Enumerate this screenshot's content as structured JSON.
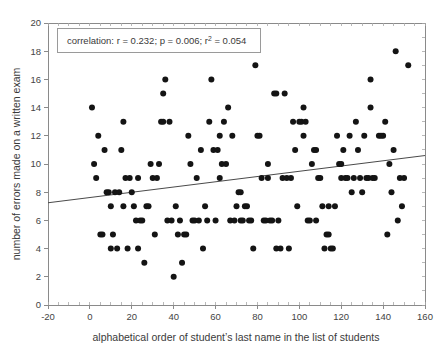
{
  "chart_data": {
    "type": "scatter",
    "title": "",
    "xlabel": "alphabetical order of student’s last name in the list of students",
    "ylabel": "number of errors made on a written exam",
    "xlim": [
      -20,
      160
    ],
    "ylim": [
      0,
      20
    ],
    "xticks": [
      -20,
      0,
      20,
      40,
      60,
      80,
      100,
      120,
      140,
      160
    ],
    "xtick_labels": [
      "-20",
      "0",
      "20",
      "40",
      "60",
      "80",
      "100",
      "120",
      "140",
      "160"
    ],
    "yticks": [
      0,
      2,
      4,
      6,
      8,
      10,
      12,
      14,
      16,
      18,
      20
    ],
    "ytick_labels": [
      "0",
      "2",
      "4",
      "6",
      "8",
      "10",
      "12",
      "14",
      "16",
      "18",
      "20"
    ],
    "grid": false,
    "legend": null,
    "marker": "filled-circle",
    "marker_color": "#141414",
    "marker_size": 3.0,
    "annotation": {
      "text_full": "correlation: r = 0.232; p = 0.006; r² = 0.054",
      "prefix": "correlation: r = 0.232; p = 0.006; r",
      "superscript": "2",
      "suffix": " = 0.054",
      "box_border_color": "#9a9a9a",
      "box_fill_color": "#ffffff"
    },
    "trendline": {
      "type": "linear-fit",
      "color": "#4a4a4a",
      "x_start": -20,
      "y_start": 7.25,
      "x_end": 160,
      "y_end": 10.6,
      "slope": 0.0186,
      "intercept": 7.62
    },
    "statistics": {
      "r": 0.232,
      "p": 0.006,
      "r_squared": 0.054
    },
    "points": [
      [
        1,
        14
      ],
      [
        2,
        10
      ],
      [
        3,
        9
      ],
      [
        4,
        12
      ],
      [
        5,
        5
      ],
      [
        6,
        5
      ],
      [
        7,
        11
      ],
      [
        9,
        8
      ],
      [
        10,
        7
      ],
      [
        10,
        4
      ],
      [
        11,
        5
      ],
      [
        12,
        8
      ],
      [
        13,
        4
      ],
      [
        14,
        8
      ],
      [
        15,
        11
      ],
      [
        16,
        13
      ],
      [
        16,
        7
      ],
      [
        17,
        9
      ],
      [
        18,
        4
      ],
      [
        20,
        8
      ],
      [
        21,
        7
      ],
      [
        22,
        6
      ],
      [
        23,
        4
      ],
      [
        23,
        9
      ],
      [
        24,
        6
      ],
      [
        25,
        6
      ],
      [
        26,
        3
      ],
      [
        27,
        7
      ],
      [
        29,
        10
      ],
      [
        30,
        9
      ],
      [
        31,
        5
      ],
      [
        32,
        9
      ],
      [
        34,
        13
      ],
      [
        35,
        13
      ],
      [
        35,
        15
      ],
      [
        36,
        16
      ],
      [
        38,
        13
      ],
      [
        39,
        6
      ],
      [
        40,
        2
      ],
      [
        41,
        7
      ],
      [
        42,
        5
      ],
      [
        43,
        6
      ],
      [
        44,
        3
      ],
      [
        45,
        5
      ],
      [
        46,
        5
      ],
      [
        47,
        12
      ],
      [
        48,
        10
      ],
      [
        49,
        6
      ],
      [
        50,
        6
      ],
      [
        51,
        9
      ],
      [
        52,
        6
      ],
      [
        53,
        11
      ],
      [
        54,
        4
      ],
      [
        55,
        7
      ],
      [
        56,
        6
      ],
      [
        57,
        13
      ],
      [
        58,
        16
      ],
      [
        59,
        11
      ],
      [
        61,
        11
      ],
      [
        62,
        9
      ],
      [
        62,
        12
      ],
      [
        63,
        10
      ],
      [
        64,
        13
      ],
      [
        65,
        10
      ],
      [
        66,
        14
      ],
      [
        67,
        6
      ],
      [
        69,
        6
      ],
      [
        70,
        7
      ],
      [
        71,
        8
      ],
      [
        72,
        8
      ],
      [
        72,
        6
      ],
      [
        74,
        7
      ],
      [
        75,
        7
      ],
      [
        76,
        6
      ],
      [
        78,
        4
      ],
      [
        79,
        17
      ],
      [
        80,
        12
      ],
      [
        81,
        12
      ],
      [
        82,
        9
      ],
      [
        83,
        6
      ],
      [
        84,
        6
      ],
      [
        85,
        10
      ],
      [
        85,
        9
      ],
      [
        86,
        6
      ],
      [
        88,
        15
      ],
      [
        89,
        15
      ],
      [
        89,
        4
      ],
      [
        90,
        6
      ],
      [
        91,
        4
      ],
      [
        92,
        9
      ],
      [
        93,
        15
      ],
      [
        94,
        9
      ],
      [
        95,
        4
      ],
      [
        97,
        13
      ],
      [
        98,
        11
      ],
      [
        99,
        7
      ],
      [
        100,
        13
      ],
      [
        101,
        13
      ],
      [
        102,
        12
      ],
      [
        102,
        14
      ],
      [
        103,
        13
      ],
      [
        104,
        6
      ],
      [
        105,
        6
      ],
      [
        106,
        10
      ],
      [
        107,
        11
      ],
      [
        108,
        11
      ],
      [
        108,
        6
      ],
      [
        110,
        9
      ],
      [
        111,
        7
      ],
      [
        112,
        4
      ],
      [
        113,
        5
      ],
      [
        114,
        5
      ],
      [
        114,
        7
      ],
      [
        115,
        4
      ],
      [
        117,
        7
      ],
      [
        118,
        12
      ],
      [
        119,
        10
      ],
      [
        120,
        10
      ],
      [
        120,
        9
      ],
      [
        121,
        11
      ],
      [
        122,
        9
      ],
      [
        124,
        12
      ],
      [
        125,
        8
      ],
      [
        126,
        9
      ],
      [
        127,
        13
      ],
      [
        128,
        11
      ],
      [
        129,
        9
      ],
      [
        130,
        8
      ],
      [
        131,
        12
      ],
      [
        132,
        9
      ],
      [
        133,
        9
      ],
      [
        134,
        14
      ],
      [
        134,
        16
      ],
      [
        136,
        9
      ],
      [
        138,
        12
      ],
      [
        140,
        12
      ],
      [
        141,
        13
      ],
      [
        142,
        5
      ],
      [
        143,
        10
      ],
      [
        144,
        8
      ],
      [
        145,
        11
      ],
      [
        146,
        18
      ],
      [
        147,
        6
      ],
      [
        148,
        9
      ],
      [
        149,
        7
      ],
      [
        150,
        9
      ],
      [
        152,
        17
      ],
      [
        8,
        8
      ],
      [
        19,
        9
      ],
      [
        28,
        7
      ],
      [
        33,
        10
      ],
      [
        37,
        6
      ],
      [
        60,
        6
      ],
      [
        68,
        12
      ],
      [
        73,
        6
      ],
      [
        77,
        6
      ],
      [
        87,
        6
      ],
      [
        96,
        9
      ],
      [
        109,
        9
      ],
      [
        116,
        4
      ],
      [
        123,
        9
      ],
      [
        135,
        9
      ],
      [
        139,
        12
      ]
    ]
  },
  "axes": {
    "x_axis_name": "x-axis",
    "y_axis_name": "y-axis"
  }
}
